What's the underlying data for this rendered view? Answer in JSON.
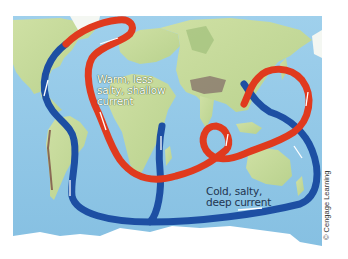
{
  "figure": {
    "labels": {
      "warm_current": [
        "Warm, less",
        "salty, shallow",
        "current"
      ],
      "cold_current": [
        "Cold, salty,",
        "deep current"
      ]
    },
    "credit": "© Cengage Learning",
    "colors": {
      "ocean": "#8ec6e6",
      "land": "#c9dba0",
      "land_dark": "#a8c58a",
      "mountains": "#8a7a6a",
      "ice": "#ffffff",
      "warm_current": "#e03a1e",
      "cold_current": "#1d4fa3",
      "flow_arrow": "#ffffff"
    }
  }
}
